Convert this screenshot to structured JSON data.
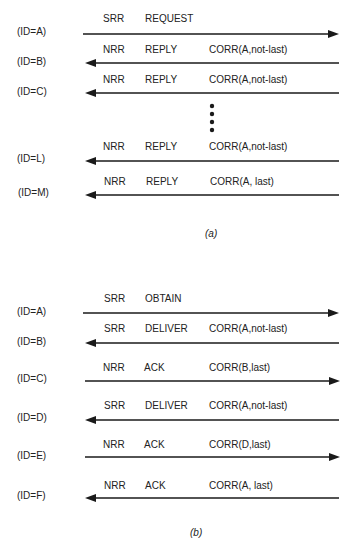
{
  "figure_a": {
    "caption": "(a)",
    "rows": [
      {
        "id": "(ID=A)",
        "flag": "SRR",
        "type": "REQUEST",
        "corr": "",
        "direction": "right"
      },
      {
        "id": "(ID=B)",
        "flag": "NRR",
        "type": "REPLY",
        "corr": "CORR(A,not-last)",
        "direction": "left"
      },
      {
        "id": "(ID=C)",
        "flag": "NRR",
        "type": "REPLY",
        "corr": "CORR(A,not-last)",
        "direction": "left"
      },
      {
        "id": "(ID=L)",
        "flag": "NRR",
        "type": "REPLY",
        "corr": "CORR(A,not-last)",
        "direction": "left"
      },
      {
        "id": "(ID=M)",
        "flag": "NRR",
        "type": "REPLY",
        "corr": "CORR(A, last)",
        "direction": "left"
      }
    ],
    "ellipsis": "vertical dots between ID=C and ID=L"
  },
  "figure_b": {
    "caption": "(b)",
    "rows": [
      {
        "id": "(ID=A)",
        "flag": "SRR",
        "type": "OBTAIN",
        "corr": "",
        "direction": "right"
      },
      {
        "id": "(ID=B)",
        "flag": "SRR",
        "type": "DELIVER",
        "corr": "CORR(A,not-last)",
        "direction": "left"
      },
      {
        "id": "(ID=C)",
        "flag": "NRR",
        "type": "ACK",
        "corr": "CORR(B,last)",
        "direction": "right"
      },
      {
        "id": "(ID=D)",
        "flag": "SRR",
        "type": "DELIVER",
        "corr": "CORR(A,not-last)",
        "direction": "left"
      },
      {
        "id": "(ID=E)",
        "flag": "NRR",
        "type": "ACK",
        "corr": "CORR(D,last)",
        "direction": "right"
      },
      {
        "id": "(ID=F)",
        "flag": "NRR",
        "type": "ACK",
        "corr": "CORR(A, last)",
        "direction": "left"
      }
    ]
  },
  "colors": {
    "line": "#1a1a1a",
    "text": "#222222",
    "background": "#ffffff"
  }
}
